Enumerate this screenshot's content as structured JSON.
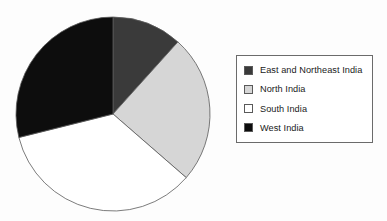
{
  "figure": {
    "name": "pie-chart-regions-of-india",
    "background_color": "#fdfdfd"
  },
  "chart_data": {
    "type": "pie",
    "title": "",
    "subtitle": "",
    "xlabel": "",
    "ylabel": "",
    "grid": false,
    "legend_position": "right",
    "start_angle_deg": 0,
    "direction": "clockwise",
    "center": {
      "x": 113,
      "y": 114
    },
    "radius": 98,
    "labels": [
      "East and Northeast India",
      "North India",
      "South India",
      "West India"
    ],
    "values": [
      11.7,
      24.7,
      34.7,
      28.9
    ],
    "angles_deg": [
      42,
      89,
      125,
      104
    ],
    "slice_bounds_deg": [
      {
        "start": 0,
        "end": 42
      },
      {
        "start": 42,
        "end": 131
      },
      {
        "start": 131,
        "end": 256
      },
      {
        "start": 256,
        "end": 360
      }
    ],
    "colors": [
      "#3a3a3a",
      "#d6d6d6",
      "#ffffff",
      "#0d0d0d"
    ],
    "slice_outline_color": "#5a5a5a",
    "slices": [
      {
        "label": "East and Northeast India",
        "value": 11.7,
        "angle_deg": 42,
        "color": "#3a3a3a"
      },
      {
        "label": "North India",
        "value": 24.7,
        "angle_deg": 89,
        "color": "#d6d6d6"
      },
      {
        "label": "South India",
        "value": 34.7,
        "angle_deg": 125,
        "color": "#ffffff"
      },
      {
        "label": "West India",
        "value": 28.9,
        "angle_deg": 104,
        "color": "#0d0d0d"
      }
    ]
  },
  "legend": {
    "border_color": "#6b6b6b",
    "background_color": "#ffffff",
    "items": [
      {
        "label": "East and Northeast India",
        "color": "#3a3a3a"
      },
      {
        "label": "North India",
        "color": "#d6d6d6"
      },
      {
        "label": "South India",
        "color": "#ffffff"
      },
      {
        "label": "West India",
        "color": "#0d0d0d"
      }
    ]
  }
}
